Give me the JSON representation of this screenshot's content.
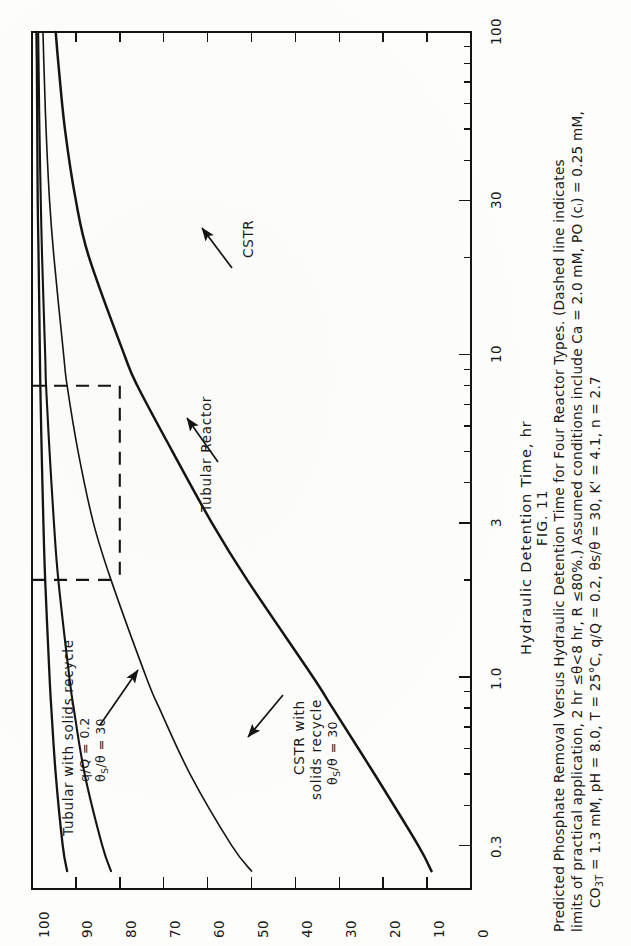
{
  "figure": {
    "number": "FIG. 11",
    "caption_lines": [
      "Predicted Phosphate Removal Versus Hydraulic Detention Time for Four Reactor Types.  (Dashed line indicates",
      "limits of practical application, 2 hr ≤θ<8 hr, R ≤80%.)  Assumed conditions include Ca = 2.0 mM, PO (cᵢ) = 0.25 mM,",
      "CO3T = 1.3 mM, pH = 8.0, T = 25°C, q/Q = 0.2, θs/θ = 30, K' = 4.1, n = 2.7"
    ],
    "caption_l3_pre": "CO",
    "caption_l3_sub1": "3",
    "caption_l3_sub2": "T",
    "caption_l3_post": " = 1.3 mM, pH = 8.0, T = 25°C, q/Q = 0.2, θs/θ = 30, K' = 4.1, n = 2.7"
  },
  "chart_data": {
    "type": "line",
    "title": "Predicted Phosphate Removal Versus Hydraulic Detention Time for Four Reactor Types",
    "xlabel": "Hydraulic Detention Time, hr",
    "ylabel": "Phosphate Removal, %",
    "xscale": "log",
    "xlim": [
      0.22,
      100
    ],
    "ylim": [
      0,
      100
    ],
    "grid": false,
    "legend": "inline-annotations",
    "x_tick_labels": [
      "0.3",
      "1.0",
      "3",
      "10",
      "30",
      "100"
    ],
    "x_tick_values": [
      0.3,
      1.0,
      3,
      10,
      30,
      100
    ],
    "y_tick_labels": [
      "100",
      "90",
      "80",
      "70",
      "60",
      "50",
      "40",
      "30",
      "20",
      "10",
      "0"
    ],
    "y_tick_values": [
      100,
      90,
      80,
      70,
      60,
      50,
      40,
      30,
      20,
      10,
      0
    ],
    "x": [
      0.25,
      0.3,
      0.5,
      0.8,
      1.0,
      2.0,
      3.0,
      5.0,
      8.0,
      10,
      20,
      30,
      50,
      80,
      100
    ],
    "series": [
      {
        "name": "Tubular with solids recycle",
        "note": "q/Q = 0.2, θs/θ = 30",
        "values": [
          92.0,
          93.0,
          94.6,
          95.6,
          96.0,
          97.0,
          97.4,
          97.8,
          98.1,
          98.2,
          98.5,
          98.7,
          98.8,
          98.9,
          99.0
        ]
      },
      {
        "name": "CSTR with solids recycle",
        "note": "θs/θ = 30",
        "values": [
          82.0,
          84.0,
          88.0,
          90.5,
          91.5,
          94.0,
          95.0,
          96.0,
          96.8,
          97.0,
          97.7,
          98.0,
          98.3,
          98.5,
          98.6
        ]
      },
      {
        "name": "Tubular Reactor",
        "note": "",
        "values": [
          50.0,
          54.5,
          64.0,
          71.0,
          74.0,
          82.0,
          86.0,
          89.5,
          92.0,
          92.8,
          95.0,
          96.0,
          96.8,
          97.3,
          97.5
        ]
      },
      {
        "name": "CSTR",
        "note": "",
        "values": [
          9.0,
          12.0,
          22.0,
          31.5,
          36.0,
          51.0,
          59.0,
          68.0,
          76.0,
          79.0,
          87.0,
          90.0,
          92.5,
          94.0,
          94.6
        ]
      }
    ],
    "annotations": [
      {
        "text": "Tubular with solids recycle",
        "sub": "q/Q = 0.2",
        "sub2": "θs/θ = 30"
      },
      {
        "text": "CSTR with solids recycle",
        "sub": "θs/θ = 30"
      },
      {
        "text": "Tubular Reactor"
      },
      {
        "text": "CSTR"
      }
    ],
    "practical_region": {
      "label": "limits of practical application",
      "theta_min_hr": 2,
      "theta_max_hr": 8,
      "removal_max_pct": 80,
      "style": "dashed"
    }
  },
  "axes": {
    "x_title": "Hydraulic Detention Time, hr",
    "x_ticks": [
      {
        "label": "0.3",
        "value": 0.3
      },
      {
        "label": "1.0",
        "value": 1.0
      },
      {
        "label": "3",
        "value": 3
      },
      {
        "label": "10",
        "value": 10
      },
      {
        "label": "30",
        "value": 30
      },
      {
        "label": "100",
        "value": 100
      }
    ],
    "y_ticks": [
      {
        "label": "100",
        "value": 100
      },
      {
        "label": "90",
        "value": 90
      },
      {
        "label": "80",
        "value": 80
      },
      {
        "label": "70",
        "value": 70
      },
      {
        "label": "60",
        "value": 60
      },
      {
        "label": "50",
        "value": 50
      },
      {
        "label": "40",
        "value": 40
      },
      {
        "label": "30",
        "value": 30
      },
      {
        "label": "20",
        "value": 20
      },
      {
        "label": "10",
        "value": 10
      },
      {
        "label": "0",
        "value": 0
      }
    ]
  },
  "labels": {
    "tubular_recycle": "Tubular with solids recycle",
    "tubular_recycle_l2": "q/Q = 0.2",
    "tubular_recycle_l3_a": "θ",
    "tubular_recycle_l3_b": "S",
    "tubular_recycle_l3_c": "/θ = 30",
    "cstr_recycle_l1": "CSTR with",
    "cstr_recycle_l2": "solids recycle",
    "cstr_recycle_l3_a": "θ",
    "cstr_recycle_l3_b": "S",
    "cstr_recycle_l3_c": "/θ = 30",
    "tubular_reactor": "Tubular Reactor",
    "cstr": "CSTR"
  },
  "colors": {
    "ink": "#141414",
    "paper": "#fdfdfb"
  }
}
